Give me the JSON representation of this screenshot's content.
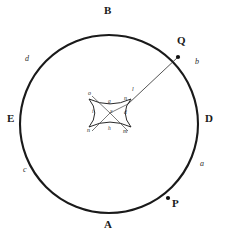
{
  "figure": {
    "background_color": "#ffffff",
    "stroke_color": "#1a1a1a",
    "circle": {
      "center_x": 109,
      "center_y": 124,
      "radius": 89,
      "stroke_width": 2.1
    },
    "cardinal_labels": [
      {
        "name": "top",
        "text": "B",
        "x": 108,
        "y": 6
      },
      {
        "name": "right",
        "text": "D",
        "x": 205,
        "y": 118
      },
      {
        "name": "bottom",
        "text": "A",
        "x": 108,
        "y": 222
      },
      {
        "name": "left",
        "text": "E",
        "x": 9,
        "y": 118
      }
    ],
    "arc_labels": [
      {
        "name": "arc-d",
        "text": "d",
        "x": 26,
        "y": 58
      },
      {
        "name": "arc-b",
        "text": "b",
        "x": 196,
        "y": 61
      },
      {
        "name": "arc-a",
        "text": "a",
        "x": 201,
        "y": 163
      },
      {
        "name": "arc-c",
        "text": "c",
        "x": 24,
        "y": 169
      }
    ],
    "points": [
      {
        "name": "point-Q",
        "text": "Q",
        "px": 178,
        "py": 57,
        "lx": 180,
        "ly": 40,
        "radius": 2.1
      },
      {
        "name": "point-P",
        "text": "P",
        "px": 168,
        "py": 198,
        "lx": 173,
        "ly": 198,
        "radius": 2.1
      }
    ],
    "ray": {
      "name": "incident-ray",
      "x1": 128,
      "y1": 104,
      "x2": 178,
      "y2": 57,
      "stroke_width": 0.8,
      "label": "l",
      "label_x": 133,
      "label_y": 90
    },
    "caustic": {
      "name": "astroid-caustic",
      "center_x": 110,
      "center_y": 113,
      "half_width": 21,
      "half_height": 14,
      "stroke_width": 0.9,
      "labels": [
        {
          "name": "caustic-label-o",
          "text": "o",
          "x": 90,
          "y": 94
        },
        {
          "name": "caustic-label-n-top",
          "text": "n",
          "x": 125,
          "y": 99
        },
        {
          "name": "caustic-label-g",
          "text": "g",
          "x": 109,
          "y": 102
        },
        {
          "name": "caustic-label-i",
          "text": "i",
          "x": 93,
          "y": 112
        },
        {
          "name": "caustic-label-x",
          "text": "x",
          "x": 111,
          "y": 112
        },
        {
          "name": "caustic-label-d",
          "text": "d",
          "x": 125,
          "y": 113
        },
        {
          "name": "caustic-label-n-left",
          "text": "n",
          "x": 89,
          "y": 130
        },
        {
          "name": "caustic-label-h",
          "text": "h",
          "x": 109,
          "y": 129
        },
        {
          "name": "caustic-label-m",
          "text": "m",
          "x": 124,
          "y": 131
        }
      ],
      "spokes": [
        {
          "name": "spoke-upper-left",
          "x1": 110,
          "y1": 113,
          "x2": 94,
          "y2": 97
        },
        {
          "name": "spoke-lower-left",
          "x1": 110,
          "y1": 113,
          "x2": 94,
          "y2": 130
        },
        {
          "name": "spoke-lower-right",
          "x1": 110,
          "y1": 113,
          "x2": 127,
          "y2": 130
        }
      ]
    }
  }
}
